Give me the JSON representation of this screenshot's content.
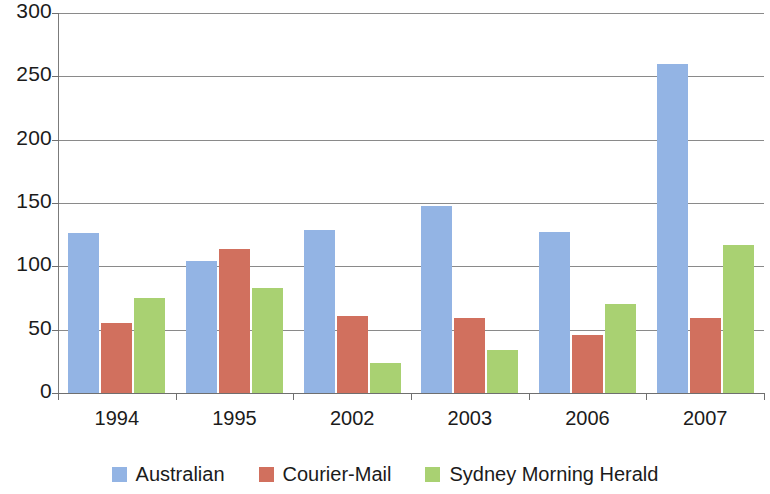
{
  "chart_data": {
    "type": "bar",
    "title": "",
    "subtitle": "",
    "xlabel": "",
    "ylabel": "",
    "categories": [
      "1994",
      "1995",
      "2002",
      "2003",
      "2006",
      "2007"
    ],
    "series": [
      {
        "name": "Australian",
        "color": "#93b4e4",
        "values": [
          126,
          104,
          129,
          148,
          127,
          260
        ]
      },
      {
        "name": "Courier-Mail",
        "color": "#d1705e",
        "values": [
          55,
          114,
          61,
          59,
          46,
          59
        ]
      },
      {
        "name": "Sydney Morning Herald",
        "color": "#a9d172",
        "values": [
          75,
          83,
          24,
          34,
          70,
          117
        ]
      }
    ],
    "ylim": [
      0,
      300
    ],
    "yticks": [
      0,
      50,
      100,
      150,
      200,
      250,
      300
    ],
    "ytick_labels": [
      "0",
      "50",
      "100",
      "150",
      "200",
      "250",
      "300"
    ],
    "xtick_labels": [
      "1994",
      "1995",
      "2002",
      "2003",
      "2006",
      "2007"
    ],
    "grid": true,
    "grid_axis": "y",
    "legend_position": "bottom",
    "legend_entries": [
      "Australian",
      "Courier-Mail",
      "Sydney Morning Herald"
    ]
  },
  "axes": {
    "y_axis_name": "y-axis",
    "x_axis_name": "x-axis"
  }
}
